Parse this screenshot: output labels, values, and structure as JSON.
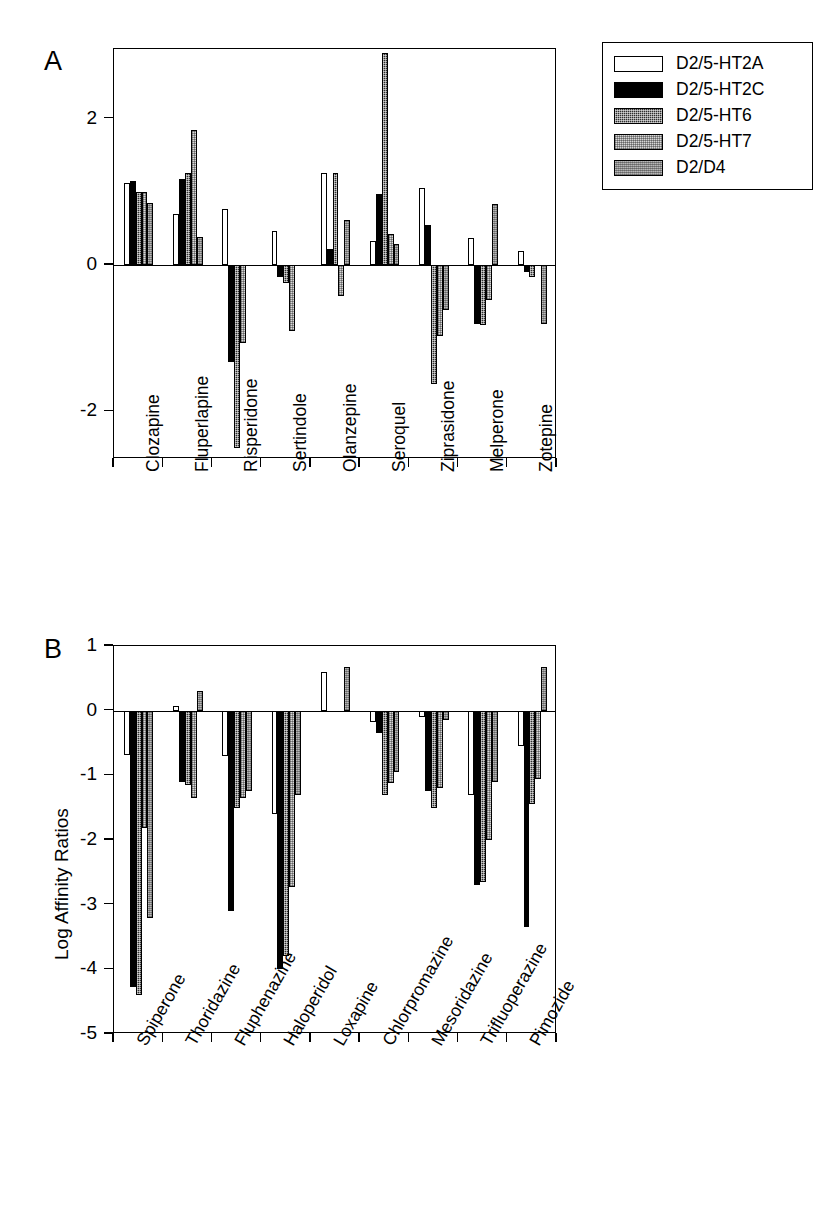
{
  "figure": {
    "panel_a_letter": "A",
    "panel_b_letter": "B",
    "panel_b_ylabel": "Log Affinity Ratios"
  },
  "legend": {
    "items": [
      {
        "label": "D2/5-HT2A",
        "fill": "open"
      },
      {
        "label": "D2/5-HT2C",
        "fill": "black"
      },
      {
        "label": "D2/5-HT6",
        "fill": "dark"
      },
      {
        "label": "D2/5-HT7",
        "fill": "light"
      },
      {
        "label": "D2/D4",
        "fill": "gray"
      }
    ]
  },
  "chart_data": [
    {
      "type": "bar",
      "panel": "A",
      "title": "",
      "xlabel": "",
      "ylabel": "",
      "ylim": [
        -2.65,
        2.95
      ],
      "yticks": [
        2,
        0,
        -2
      ],
      "ytick_labels": [
        "2",
        "0",
        "-2"
      ],
      "grid": false,
      "legend_position": "outside-top-right",
      "categories": [
        "Clozapine",
        "Fluperlapine",
        "Risperidone",
        "Sertindole",
        "Olanzepine",
        "Seroquel",
        "Ziprasidone",
        "Melperone",
        "Zotepine"
      ],
      "series": [
        {
          "name": "D2/5-HT2A",
          "fill": "open",
          "values": [
            1.12,
            0.7,
            0.77,
            0.47,
            1.25,
            0.33,
            1.05,
            0.37,
            0.19
          ]
        },
        {
          "name": "D2/5-HT2C",
          "fill": "black",
          "values": [
            1.15,
            1.18,
            -1.33,
            -0.16,
            0.22,
            0.97,
            0.55,
            -0.8,
            -0.09
          ]
        },
        {
          "name": "D2/5-HT6",
          "fill": "dark",
          "values": [
            1.0,
            1.25,
            -2.5,
            -0.25,
            1.25,
            2.9,
            -1.62,
            -0.82,
            -0.17
          ]
        },
        {
          "name": "D2/5-HT7",
          "fill": "light",
          "values": [
            1.0,
            1.85,
            -1.07,
            -0.9,
            -0.42,
            0.43,
            -0.97,
            -0.48,
            0.0
          ]
        },
        {
          "name": "D2/D4",
          "fill": "gray",
          "values": [
            0.85,
            0.38,
            0.0,
            0.0,
            0.62,
            0.28,
            -0.62,
            0.83,
            -0.8
          ]
        }
      ]
    },
    {
      "type": "bar",
      "panel": "B",
      "title": "",
      "xlabel": "",
      "ylabel": "Log Affinity Ratios",
      "ylim": [
        -5,
        1
      ],
      "yticks": [
        1,
        0,
        -1,
        -2,
        -3,
        -4,
        -5
      ],
      "ytick_labels": [
        "1",
        "0",
        "-1",
        "-2",
        "-3",
        "-4",
        "-5"
      ],
      "grid": false,
      "legend_position": "shared-with-panel-a",
      "categories": [
        "Spiperone",
        "Thoridazine",
        "Fluphenazine",
        "Haloperidol",
        "Loxapine",
        "Chlorpromazine",
        "Mesoridazine",
        "Trifluoperazine",
        "Pimozide"
      ],
      "series": [
        {
          "name": "D2/5-HT2A",
          "fill": "open",
          "values": [
            -0.68,
            0.07,
            -0.7,
            -1.6,
            0.6,
            -0.18,
            -0.1,
            -1.3,
            -0.55
          ]
        },
        {
          "name": "D2/5-HT2C",
          "fill": "black",
          "values": [
            -4.27,
            -1.1,
            -3.1,
            -4.0,
            0.0,
            -0.35,
            -1.25,
            -2.7,
            -3.35
          ]
        },
        {
          "name": "D2/5-HT6",
          "fill": "dark",
          "values": [
            -4.4,
            -1.15,
            -1.5,
            -3.8,
            0.0,
            -1.3,
            -1.5,
            -2.65,
            -1.45
          ]
        },
        {
          "name": "D2/5-HT7",
          "fill": "light",
          "values": [
            -1.82,
            -1.35,
            -1.35,
            -2.73,
            0.0,
            -1.12,
            -1.2,
            -2.0,
            -1.05
          ]
        },
        {
          "name": "D2/D4",
          "fill": "gray",
          "values": [
            -3.2,
            0.3,
            -1.25,
            -1.3,
            0.67,
            -0.95,
            -0.15,
            -1.1,
            0.68
          ]
        }
      ]
    }
  ]
}
